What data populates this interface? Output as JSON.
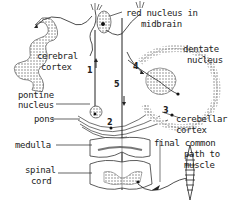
{
  "diagram": {
    "labels": {
      "red_nucleus_line1": "red nucleus in",
      "red_nucleus_line2": "midbrain",
      "cerebral_line1": "cerebral",
      "cerebral_line2": "cortex",
      "dentate_line1": "dentate",
      "dentate_line2": "nucleus",
      "pontine_line1": "pontine",
      "pontine_line2": "nucleus",
      "pons": "pons",
      "cerebellar_line1": "cerebellar",
      "cerebellar_line2": "cortex",
      "medulla": "medulla",
      "spinal_line1": "spinal",
      "spinal_line2": "cord",
      "final_line1": "final common",
      "final_line2": "path to",
      "final_line3": "muscle"
    },
    "pathway_numbers": [
      "1",
      "2",
      "3",
      "4",
      "5"
    ],
    "colors": {
      "ink": "#222222",
      "background": "#ffffff",
      "stipple": "#9a9a9a"
    }
  }
}
